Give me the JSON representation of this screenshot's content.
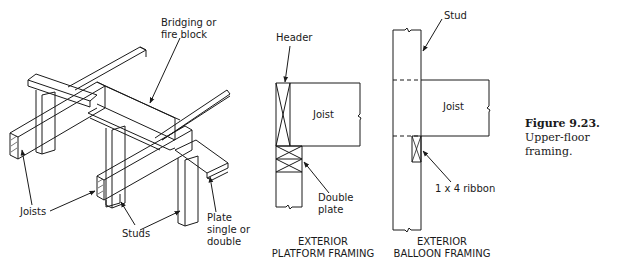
{
  "figure": {
    "number": "Figure 9.23.",
    "caption": "Upper-floor framing."
  },
  "isometric": {
    "labels": {
      "bridging": [
        "Bridging or",
        "fire block"
      ],
      "joists": "Joists",
      "studs": "Studs",
      "plate": [
        "Plate",
        "single or",
        "double"
      ]
    }
  },
  "platform": {
    "labels": {
      "header": "Header",
      "joist": "Joist",
      "double_plate": [
        "Double",
        "plate"
      ]
    },
    "caption": [
      "EXTERIOR",
      "PLATFORM FRAMING"
    ]
  },
  "balloon": {
    "labels": {
      "stud": "Stud",
      "joist": "Joist",
      "ribbon": "1 x 4  ribbon"
    },
    "caption": [
      "EXTERIOR",
      "BALLOON FRAMING"
    ]
  },
  "colors": {
    "line": "#1a1a1a",
    "background": "#ffffff"
  }
}
